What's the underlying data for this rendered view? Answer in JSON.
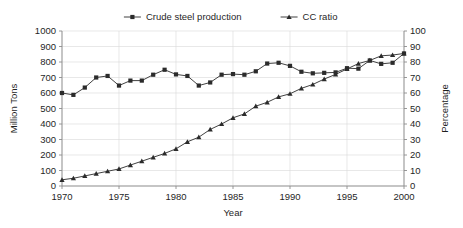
{
  "chart_data": {
    "type": "line",
    "title": "",
    "xlabel": "Year",
    "ylabel": "Million Tons",
    "y2label": "Percentage",
    "x": [
      1970,
      1971,
      1972,
      1973,
      1974,
      1975,
      1976,
      1977,
      1978,
      1979,
      1980,
      1981,
      1982,
      1983,
      1984,
      1985,
      1986,
      1987,
      1988,
      1989,
      1990,
      1991,
      1992,
      1993,
      1994,
      1995,
      1996,
      1997,
      1998,
      1999,
      2000
    ],
    "xlim": [
      1970,
      2000
    ],
    "xticks": [
      1970,
      1975,
      1980,
      1985,
      1990,
      1995,
      2000
    ],
    "xtick_labels": [
      "1970",
      "1975",
      "1980",
      "1985",
      "1990",
      "1995",
      "2000"
    ],
    "ylim": [
      0,
      1000
    ],
    "yticks": [
      0,
      100,
      200,
      300,
      400,
      500,
      600,
      700,
      800,
      900,
      1000
    ],
    "ytick_labels": [
      "0",
      "100",
      "200",
      "300",
      "400",
      "500",
      "600",
      "700",
      "800",
      "900",
      "1000"
    ],
    "y2lim": [
      0,
      100
    ],
    "y2ticks": [
      0,
      10,
      20,
      30,
      40,
      50,
      60,
      70,
      80,
      90,
      100
    ],
    "y2tick_labels": [
      "0",
      "10",
      "20",
      "30",
      "40",
      "50",
      "60",
      "70",
      "80",
      "90",
      "100"
    ],
    "grid": true,
    "legend_position": "top-center",
    "series": [
      {
        "name": "Crude steel production",
        "axis": "left",
        "marker": "square",
        "values": [
          600,
          588,
          635,
          700,
          710,
          648,
          680,
          680,
          718,
          750,
          720,
          710,
          648,
          668,
          718,
          722,
          718,
          740,
          790,
          795,
          775,
          737,
          727,
          730,
          733,
          760,
          757,
          810,
          788,
          795,
          855
        ]
      },
      {
        "name": "CC ratio",
        "axis": "right",
        "marker": "triangle",
        "values": [
          4,
          5,
          6.5,
          8,
          9.5,
          11,
          13.5,
          16,
          18.5,
          21,
          24,
          28.5,
          31.5,
          36.5,
          40,
          44,
          46.5,
          51.5,
          54,
          57.5,
          59.5,
          63,
          65.5,
          69,
          72,
          75.5,
          79,
          81,
          84,
          84.5,
          85.5
        ]
      }
    ]
  },
  "legend": {
    "items": [
      {
        "label": "Crude steel production",
        "marker": "square"
      },
      {
        "label": "CC ratio",
        "marker": "triangle"
      }
    ]
  }
}
